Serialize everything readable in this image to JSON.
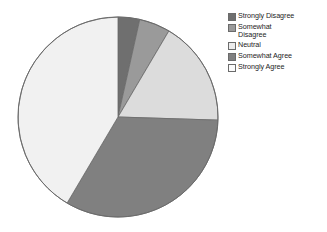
{
  "chart_data": {
    "type": "pie",
    "title": "",
    "legend_position": "right",
    "categories": [
      "Strongly Disagree",
      "Somewhat Disagree",
      "Neutral",
      "Somewhat Agree",
      "Strongly Agree"
    ],
    "values": [
      3.5,
      5.0,
      17.0,
      33.0,
      41.5
    ],
    "unit": "percent",
    "colors": [
      "#6f6f6f",
      "#9a9a9a",
      "#dcdcdc",
      "#808080",
      "#f1f1f1"
    ],
    "start_angle_deg": 0,
    "direction": "clockwise",
    "slices": [
      {
        "label": "Strongly Disagree",
        "value": 3.5,
        "color": "#6f6f6f"
      },
      {
        "label": "Somewhat Disagree",
        "value": 5.0,
        "color": "#9a9a9a"
      },
      {
        "label": "Neutral",
        "value": 17.0,
        "color": "#dcdcdc"
      },
      {
        "label": "Somewhat Agree",
        "value": 33.0,
        "color": "#808080"
      },
      {
        "label": "Strongly Agree",
        "value": 41.5,
        "color": "#f1f1f1"
      }
    ]
  },
  "legend": {
    "items": [
      {
        "label": "Strongly Disagree",
        "color": "#6f6f6f"
      },
      {
        "label": "Somewhat\nDisagree",
        "color": "#9a9a9a"
      },
      {
        "label": "Neutral",
        "color": "#ececec"
      },
      {
        "label": "Somewhat Agree",
        "color": "#808080"
      },
      {
        "label": "Strongly Agree",
        "color": "#fbfbfb"
      }
    ]
  },
  "style": {
    "background": "#ffffff",
    "outline": "#6b6b6b",
    "text": "#1d1d1d"
  }
}
